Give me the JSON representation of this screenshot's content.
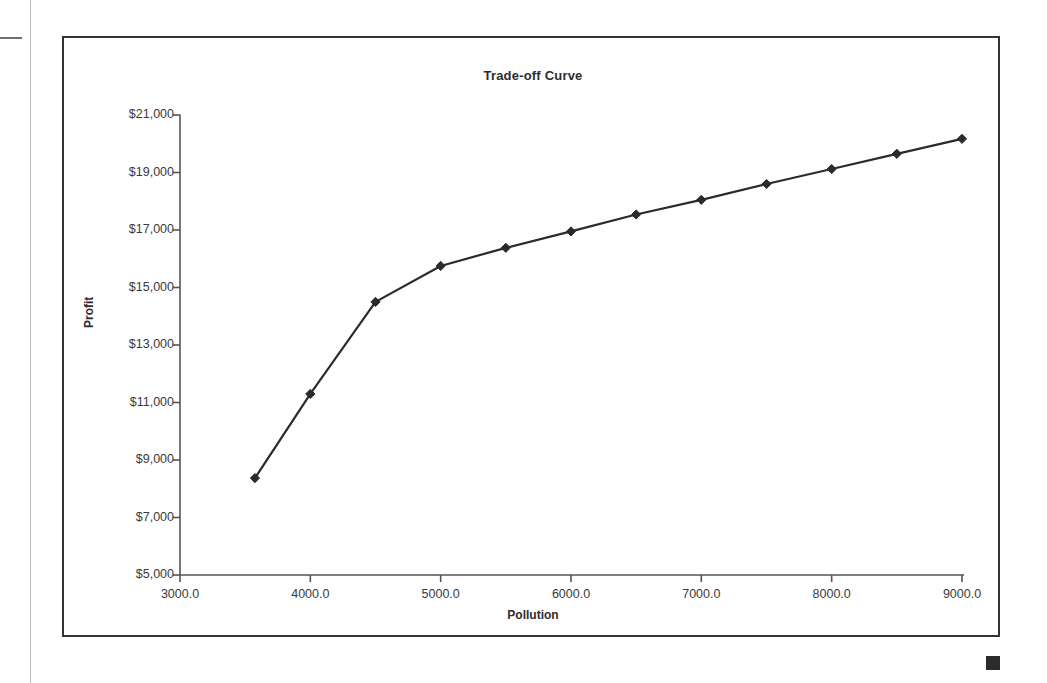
{
  "page": {
    "corner_mark_color": "#2b2b2b",
    "rule_color": "#b9b9b9"
  },
  "chart": {
    "title": "Trade-off Curve",
    "xlabel": "Pollution",
    "ylabel": "Profit",
    "line_color": "#2b2b2b",
    "frame_color": "#333333",
    "axis_color": "#555555"
  },
  "chart_data": {
    "type": "line",
    "title": "Trade-off Curve",
    "xlabel": "Pollution",
    "ylabel": "Profit",
    "xlim": [
      3000,
      9000
    ],
    "ylim": [
      5000,
      21000
    ],
    "grid": false,
    "legend": false,
    "marker": "diamond",
    "x_tick_labels": [
      "3000.0",
      "4000.0",
      "5000.0",
      "6000.0",
      "7000.0",
      "8000.0",
      "9000.0"
    ],
    "x_ticks": [
      3000,
      4000,
      5000,
      6000,
      7000,
      8000,
      9000
    ],
    "y_tick_labels": [
      "$5,000",
      "$7,000",
      "$9,000",
      "$11,000",
      "$13,000",
      "$15,000",
      "$17,000",
      "$19,000",
      "$21,000"
    ],
    "y_ticks": [
      5000,
      7000,
      9000,
      11000,
      13000,
      15000,
      17000,
      19000,
      21000
    ],
    "series": [
      {
        "name": "Trade-off Curve",
        "x": [
          3575,
          4000,
          4500,
          5000,
          5500,
          6000,
          6500,
          7000,
          7500,
          8000,
          8500,
          9000
        ],
        "values": [
          8370,
          11300,
          14500,
          15750,
          16380,
          16950,
          17540,
          18050,
          18600,
          19120,
          19650,
          20170
        ]
      }
    ]
  }
}
